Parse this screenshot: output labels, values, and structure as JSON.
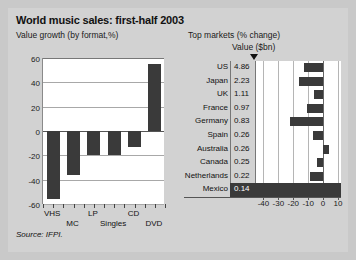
{
  "title": "World music sales: first-half 2003",
  "subtitle_left": "Value growth (by format,%)",
  "subtitle_right": "Top markets (% change)",
  "value_header": "Value ($bn)",
  "source": "Source: IFPI.",
  "colors": {
    "bar": "#3a3a3a",
    "panel_bg": "#d2d2d2",
    "plot_bg": "#ffffff",
    "outer_bg": "#c9c9c9",
    "highlight": "#3a3a3a"
  },
  "chart_data": [
    {
      "type": "bar",
      "title": "Value growth (by format,%)",
      "categories": [
        "VHS",
        "MC",
        "LP",
        "Singles",
        "CD",
        "DVD"
      ],
      "values": [
        -56,
        -36,
        -20,
        -20,
        -13,
        55
      ],
      "xlabel": "",
      "ylabel": "",
      "ylim": [
        -60,
        60
      ],
      "yticks": [
        60,
        40,
        20,
        0,
        -20,
        -40,
        -60
      ],
      "ytick_labels": [
        "60",
        "40",
        "20",
        "0",
        "-20",
        "-40",
        "-60"
      ],
      "grid": true,
      "legend": "none"
    },
    {
      "type": "bar",
      "orientation": "horizontal",
      "title": "Top markets (% change)",
      "value_column_header": "Value ($bn)",
      "categories": [
        "US",
        "Japan",
        "UK",
        "France",
        "Germany",
        "Spain",
        "Australia",
        "Canada",
        "Netherlands",
        "Mexico"
      ],
      "value_sbn": [
        "4.86",
        "2.23",
        "1.11",
        "0.97",
        "0.83",
        "0.26",
        "0.26",
        "0.25",
        "0.22",
        "0.14"
      ],
      "values": [
        -13,
        -16,
        -6,
        -11,
        -22,
        -7,
        4,
        -4,
        -9,
        -33
      ],
      "highlight_category": "Mexico",
      "xlabel": "",
      "ylabel": "",
      "xlim": [
        -45,
        12
      ],
      "xticks": [
        -40,
        -30,
        -20,
        -10,
        0,
        10
      ],
      "xtick_labels": [
        "-40",
        "-30",
        "-20",
        "-10",
        "0",
        "10"
      ],
      "grid": true,
      "legend": "none"
    }
  ],
  "left_chart": {
    "ytick_labels": [
      "60",
      "40",
      "20",
      "0",
      "-20",
      "-40",
      "-60"
    ],
    "bars": [
      {
        "label": "VHS",
        "value": -56
      },
      {
        "label": "MC",
        "value": -36
      },
      {
        "label": "LP",
        "value": -20
      },
      {
        "label": "Singles",
        "value": -20
      },
      {
        "label": "CD",
        "value": -13
      },
      {
        "label": "DVD",
        "value": 55
      }
    ]
  },
  "right_chart": {
    "xtick_labels": [
      "-40",
      "-30",
      "-20",
      "-10",
      "0",
      "10"
    ],
    "rows": [
      {
        "name": "US",
        "value": "4.86",
        "change": -13,
        "highlight": false
      },
      {
        "name": "Japan",
        "value": "2.23",
        "change": -16,
        "highlight": false
      },
      {
        "name": "UK",
        "value": "1.11",
        "change": -6,
        "highlight": false
      },
      {
        "name": "France",
        "value": "0.97",
        "change": -11,
        "highlight": false
      },
      {
        "name": "Germany",
        "value": "0.83",
        "change": -22,
        "highlight": false
      },
      {
        "name": "Spain",
        "value": "0.26",
        "change": -7,
        "highlight": false
      },
      {
        "name": "Australia",
        "value": "0.26",
        "change": 4,
        "highlight": false
      },
      {
        "name": "Canada",
        "value": "0.25",
        "change": -4,
        "highlight": false
      },
      {
        "name": "Netherlands",
        "value": "0.22",
        "change": -9,
        "highlight": false
      },
      {
        "name": "Mexico",
        "value": "0.14",
        "change": -33,
        "highlight": true
      }
    ]
  }
}
